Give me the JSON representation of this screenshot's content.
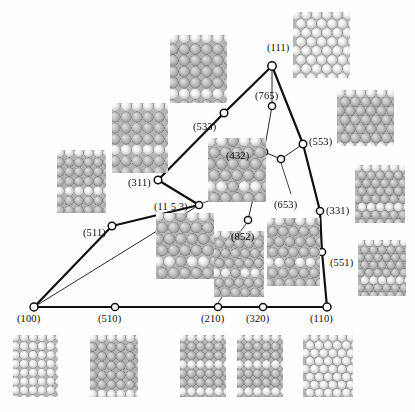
{
  "figure": {
    "type": "stereographic-triangle",
    "colors": {
      "line": "#111111",
      "node_fill": "#ffffff",
      "node_stroke": "#111111",
      "label": "#0d0d0d",
      "atom_light": "#f2f2f2",
      "atom_mid": "#c9c9c9",
      "atom_dark": "#8f8f8f",
      "background": "#ffffff"
    }
  },
  "nodes": [
    {
      "id": "100",
      "label": "(100)",
      "x": 34,
      "y": 307,
      "r": 4.0,
      "label_x": 17,
      "label_y": 314
    },
    {
      "id": "510",
      "label": "(510)",
      "x": 115,
      "y": 307,
      "r": 3.6,
      "label_x": 98,
      "label_y": 314
    },
    {
      "id": "210",
      "label": "(210)",
      "x": 218,
      "y": 307,
      "r": 3.6,
      "label_x": 201,
      "label_y": 314
    },
    {
      "id": "320",
      "label": "(320)",
      "x": 263,
      "y": 307,
      "r": 3.6,
      "label_x": 246,
      "label_y": 314
    },
    {
      "id": "110",
      "label": "(110)",
      "x": 327,
      "y": 307,
      "r": 4.0,
      "label_x": 310,
      "label_y": 314
    },
    {
      "id": "551",
      "label": "(551)",
      "x": 322,
      "y": 252,
      "r": 3.6,
      "label_x": 330,
      "label_y": 258
    },
    {
      "id": "331",
      "label": "(331)",
      "x": 320,
      "y": 211,
      "r": 3.6,
      "label_x": 326,
      "label_y": 206
    },
    {
      "id": "553",
      "label": "(553)",
      "x": 303,
      "y": 144,
      "r": 3.8,
      "label_x": 309,
      "label_y": 137
    },
    {
      "id": "111",
      "label": "(111)",
      "x": 272,
      "y": 66,
      "r": 4.2,
      "label_x": 267,
      "label_y": 43
    },
    {
      "id": "765",
      "label": "(765)",
      "x": 272,
      "y": 106,
      "r": 3.6,
      "label_x": 255,
      "label_y": 91
    },
    {
      "id": "432",
      "label": "(432)",
      "x": 264,
      "y": 152,
      "r": 3.6,
      "label_x": 226,
      "label_y": 151
    },
    {
      "id": "653",
      "label": "(653)",
      "x": 281,
      "y": 159,
      "r": 3.6,
      "label_x": 274,
      "label_y": 200
    },
    {
      "id": "852",
      "label": "(852)",
      "x": 248,
      "y": 220,
      "r": 3.6,
      "label_x": 231,
      "label_y": 232
    },
    {
      "id": "11 5 3",
      "label": "(11 5 3)",
      "x": 199,
      "y": 205,
      "r": 3.6,
      "label_x": 154,
      "label_y": 202
    },
    {
      "id": "533",
      "label": "(533)",
      "x": 224,
      "y": 113,
      "r": 3.8,
      "label_x": 193,
      "label_y": 122
    },
    {
      "id": "311",
      "label": "(311)",
      "x": 158,
      "y": 180,
      "r": 3.8,
      "label_x": 128,
      "label_y": 178
    },
    {
      "id": "511",
      "label": "(511)",
      "x": 112,
      "y": 226,
      "r": 3.8,
      "label_x": 83,
      "label_y": 228
    }
  ],
  "edges": [
    {
      "from": "100",
      "to": "510",
      "thick": true
    },
    {
      "from": "510",
      "to": "210",
      "thick": true
    },
    {
      "from": "210",
      "to": "320",
      "thick": true
    },
    {
      "from": "320",
      "to": "110",
      "thick": true
    },
    {
      "from": "110",
      "to": "551",
      "thick": true
    },
    {
      "from": "551",
      "to": "331",
      "thick": true
    },
    {
      "from": "331",
      "to": "553",
      "thick": true
    },
    {
      "from": "553",
      "to": "111",
      "thick": true
    },
    {
      "from": "111",
      "to": "533",
      "thick": true
    },
    {
      "from": "533",
      "to": "311",
      "thick": true
    },
    {
      "from": "311",
      "to": "11 5 3",
      "thick": true
    },
    {
      "from": "11 5 3",
      "to": "511",
      "thick": true
    },
    {
      "from": "511",
      "to": "100",
      "thick": true
    },
    {
      "from": "111",
      "to": "765",
      "thick": false
    },
    {
      "from": "765",
      "to": "432",
      "thick": false
    },
    {
      "from": "432",
      "to": "852",
      "thick": false
    },
    {
      "from": "432",
      "to": "653",
      "thick": false
    },
    {
      "from": "653",
      "to": "553",
      "thick": false
    },
    {
      "from": "100",
      "to": "11 5 3",
      "thick": false
    },
    {
      "from": "100",
      "to": "210",
      "thick": false
    }
  ],
  "leaders": [
    {
      "name": "leader-653",
      "x1": 281,
      "y1": 163,
      "x2": 291,
      "y2": 194
    },
    {
      "name": "leader-11-5-3",
      "x1": 203,
      "y1": 203,
      "x2": 226,
      "y2": 194
    },
    {
      "name": "leader-210-model",
      "x1": 218,
      "y1": 303,
      "x2": 228,
      "y2": 288
    },
    {
      "name": "leader-852-model",
      "x1": 246,
      "y1": 224,
      "x2": 240,
      "y2": 232
    }
  ],
  "models": [
    {
      "name": "model-111",
      "for": "(111)",
      "x": 293,
      "y": 12,
      "w": 57,
      "h": 66,
      "kind": "hex",
      "steps": 0,
      "terrace": 0
    },
    {
      "name": "model-533",
      "for": "(533)",
      "x": 170,
      "y": 35,
      "w": 57,
      "h": 68,
      "kind": "square",
      "steps": 2,
      "terrace": 4
    },
    {
      "name": "model-553",
      "for": "(553)",
      "x": 337,
      "y": 90,
      "w": 57,
      "h": 56,
      "kind": "hex",
      "steps": 2,
      "terrace": 5
    },
    {
      "name": "model-311",
      "for": "(311)",
      "x": 112,
      "y": 103,
      "w": 56,
      "h": 70,
      "kind": "square",
      "steps": 3,
      "terrace": 3
    },
    {
      "name": "model-432",
      "for": "(432)",
      "x": 208,
      "y": 138,
      "w": 58,
      "h": 64,
      "kind": "kink",
      "steps": 3,
      "terrace": 3
    },
    {
      "name": "model-511",
      "for": "(511)",
      "x": 57,
      "y": 150,
      "w": 49,
      "h": 63,
      "kind": "square",
      "steps": 3,
      "terrace": 3
    },
    {
      "name": "model-331",
      "for": "(331)",
      "x": 355,
      "y": 165,
      "w": 50,
      "h": 58,
      "kind": "hex",
      "steps": 2,
      "terrace": 4
    },
    {
      "name": "model-11-5-3",
      "for": "(11 5 3)",
      "x": 156,
      "y": 213,
      "w": 58,
      "h": 66,
      "kind": "kink",
      "steps": 3,
      "terrace": 3
    },
    {
      "name": "model-653",
      "for": "(653)",
      "x": 267,
      "y": 218,
      "w": 53,
      "h": 68,
      "kind": "kink",
      "steps": 3,
      "terrace": 3
    },
    {
      "name": "model-551",
      "for": "(551)",
      "x": 358,
      "y": 240,
      "w": 48,
      "h": 56,
      "kind": "hex",
      "steps": 2,
      "terrace": 4
    },
    {
      "name": "model-852",
      "for": "(852)",
      "x": 214,
      "y": 231,
      "w": 50,
      "h": 66,
      "kind": "kink",
      "steps": 3,
      "terrace": 3
    },
    {
      "name": "model-100-bottom",
      "for": "(100)",
      "x": 13,
      "y": 335,
      "w": 45,
      "h": 62,
      "kind": "square",
      "steps": 0,
      "terrace": 0
    },
    {
      "name": "model-510-bottom",
      "for": "(510)",
      "x": 90,
      "y": 335,
      "w": 48,
      "h": 62,
      "kind": "square",
      "steps": 2,
      "terrace": 5
    },
    {
      "name": "model-210-bottom",
      "for": "(210)",
      "x": 180,
      "y": 335,
      "w": 46,
      "h": 62,
      "kind": "square",
      "steps": 3,
      "terrace": 2
    },
    {
      "name": "model-320-bottom",
      "for": "(320)",
      "x": 237,
      "y": 335,
      "w": 46,
      "h": 62,
      "kind": "square",
      "steps": 3,
      "terrace": 2
    },
    {
      "name": "model-110-bottom",
      "for": "(110)",
      "x": 303,
      "y": 335,
      "w": 50,
      "h": 62,
      "kind": "hex",
      "steps": 0,
      "terrace": 0
    }
  ]
}
